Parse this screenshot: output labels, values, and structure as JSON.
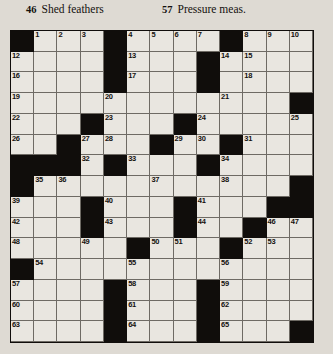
{
  "header": {
    "clues": [
      {
        "number": "46",
        "text": "Shed feathers"
      },
      {
        "number": "57",
        "text": "Pressure meas."
      }
    ]
  },
  "grid": {
    "rows": 15,
    "columns": 13,
    "colors": {
      "block": "#100d0b",
      "cell": "#e9e6e0",
      "rule": "#6e6a64",
      "page": "#dedad3",
      "text": "#14110e"
    },
    "layout": [
      "#...#....#....",
      "....#....#....",
      "....#....#....",
      "............#",
      "...#...#.....",
      "..#...#..#...",
      "###.#...#....",
      "#..........#.",
      "...#...#..###",
      "...#...#..#..",
      ".....#...#...",
      "#............",
      "....#...#....",
      "....#...#....",
      "....#...#...#"
    ],
    "numbers": {
      "0": {
        "1": "1",
        "2": "2",
        "3": "3",
        "5": "4",
        "6": "5",
        "7": "6",
        "8": "7",
        "10": "8",
        "11": "9",
        "12": "10"
      },
      "0b": {},
      "1": {
        "0": "12",
        "5": "13",
        "9": "14",
        "10": "15"
      },
      "2": {
        "0": "16",
        "5": "17",
        "10": "18"
      },
      "3": {
        "0": "19",
        "4": "20",
        "9": "21"
      },
      "4": {
        "0": "22",
        "4": "23",
        "8": "24",
        "12": "25"
      },
      "5": {
        "0": "26",
        "3": "27",
        "4": "28",
        "7": "29",
        "8": "30",
        "10": "31"
      },
      "6": {
        "3": "32",
        "5": "33",
        "9": "34"
      },
      "7": {
        "1": "35",
        "2": "36",
        "6": "37",
        "9": "38"
      },
      "8": {
        "0": "39",
        "4": "40",
        "8": "41"
      },
      "9": {
        "0": "42",
        "4": "43",
        "8": "44",
        "11": "45",
        "12": "46",
        "13": "47"
      },
      "10": {
        "0": "48",
        "3": "49",
        "6": "50",
        "7": "51",
        "10": "52",
        "11": "53"
      },
      "11": {
        "1": "54",
        "5": "55",
        "9": "56"
      },
      "12": {
        "0": "57",
        "5": "58",
        "9": "59"
      },
      "13": {
        "0": "60",
        "5": "61",
        "9": "62"
      },
      "14": {
        "0": "63",
        "5": "64",
        "9": "65"
      }
    },
    "numbers_flat": [
      {
        "row": 0,
        "col": 1,
        "n": "1"
      },
      {
        "row": 0,
        "col": 2,
        "n": "2"
      },
      {
        "row": 0,
        "col": 3,
        "n": "3"
      },
      {
        "row": 0,
        "col": 5,
        "n": "4"
      },
      {
        "row": 0,
        "col": 6,
        "n": "5"
      },
      {
        "row": 0,
        "col": 7,
        "n": "6"
      },
      {
        "row": 0,
        "col": 8,
        "n": "7"
      },
      {
        "row": 0,
        "col": 10,
        "n": "8"
      },
      {
        "row": 0,
        "col": 11,
        "n": "9"
      },
      {
        "row": 0,
        "col": 12,
        "n": "10"
      },
      {
        "row": 0,
        "col": 12,
        "n": "11"
      },
      {
        "row": 1,
        "col": 0,
        "n": "12"
      },
      {
        "row": 1,
        "col": 5,
        "n": "13"
      },
      {
        "row": 1,
        "col": 9,
        "n": "14"
      },
      {
        "row": 1,
        "col": 10,
        "n": "15"
      },
      {
        "row": 2,
        "col": 0,
        "n": "16"
      },
      {
        "row": 2,
        "col": 5,
        "n": "17"
      },
      {
        "row": 2,
        "col": 10,
        "n": "18"
      },
      {
        "row": 3,
        "col": 0,
        "n": "19"
      },
      {
        "row": 3,
        "col": 4,
        "n": "20"
      },
      {
        "row": 3,
        "col": 9,
        "n": "21"
      },
      {
        "row": 4,
        "col": 0,
        "n": "22"
      },
      {
        "row": 4,
        "col": 4,
        "n": "23"
      },
      {
        "row": 4,
        "col": 8,
        "n": "24"
      },
      {
        "row": 4,
        "col": 12,
        "n": "25"
      },
      {
        "row": 5,
        "col": 0,
        "n": "26"
      },
      {
        "row": 5,
        "col": 3,
        "n": "27"
      },
      {
        "row": 5,
        "col": 4,
        "n": "28"
      },
      {
        "row": 5,
        "col": 7,
        "n": "29"
      },
      {
        "row": 5,
        "col": 8,
        "n": "30"
      },
      {
        "row": 5,
        "col": 10,
        "n": "31"
      },
      {
        "row": 6,
        "col": 3,
        "n": "32"
      },
      {
        "row": 6,
        "col": 5,
        "n": "33"
      },
      {
        "row": 6,
        "col": 9,
        "n": "34"
      },
      {
        "row": 7,
        "col": 1,
        "n": "35"
      },
      {
        "row": 7,
        "col": 2,
        "n": "36"
      },
      {
        "row": 7,
        "col": 6,
        "n": "37"
      },
      {
        "row": 7,
        "col": 9,
        "n": "38"
      },
      {
        "row": 8,
        "col": 0,
        "n": "39"
      },
      {
        "row": 8,
        "col": 4,
        "n": "40"
      },
      {
        "row": 8,
        "col": 8,
        "n": "41"
      },
      {
        "row": 9,
        "col": 0,
        "n": "42"
      },
      {
        "row": 9,
        "col": 4,
        "n": "43"
      },
      {
        "row": 9,
        "col": 8,
        "n": "44"
      },
      {
        "row": 9,
        "col": 10,
        "n": "45"
      },
      {
        "row": 9,
        "col": 11,
        "n": "46"
      },
      {
        "row": 9,
        "col": 12,
        "n": "47"
      },
      {
        "row": 10,
        "col": 0,
        "n": "48"
      },
      {
        "row": 10,
        "col": 3,
        "n": "49"
      },
      {
        "row": 10,
        "col": 6,
        "n": "50"
      },
      {
        "row": 10,
        "col": 7,
        "n": "51"
      },
      {
        "row": 10,
        "col": 10,
        "n": "52"
      },
      {
        "row": 10,
        "col": 11,
        "n": "53"
      },
      {
        "row": 11,
        "col": 1,
        "n": "54"
      },
      {
        "row": 11,
        "col": 5,
        "n": "55"
      },
      {
        "row": 11,
        "col": 9,
        "n": "56"
      },
      {
        "row": 12,
        "col": 0,
        "n": "57"
      },
      {
        "row": 12,
        "col": 5,
        "n": "58"
      },
      {
        "row": 12,
        "col": 9,
        "n": "59"
      },
      {
        "row": 13,
        "col": 0,
        "n": "60"
      },
      {
        "row": 13,
        "col": 5,
        "n": "61"
      },
      {
        "row": 13,
        "col": 9,
        "n": "62"
      },
      {
        "row": 14,
        "col": 0,
        "n": "63"
      },
      {
        "row": 14,
        "col": 5,
        "n": "64"
      },
      {
        "row": 14,
        "col": 9,
        "n": "65"
      }
    ],
    "blocks": [
      {
        "row": 0,
        "col": 0
      },
      {
        "row": 0,
        "col": 4
      },
      {
        "row": 0,
        "col": 9
      },
      {
        "row": 1,
        "col": 4
      },
      {
        "row": 1,
        "col": 8
      },
      {
        "row": 2,
        "col": 4
      },
      {
        "row": 2,
        "col": 8
      },
      {
        "row": 3,
        "col": 12
      },
      {
        "row": 4,
        "col": 3
      },
      {
        "row": 4,
        "col": 7
      },
      {
        "row": 5,
        "col": 2
      },
      {
        "row": 5,
        "col": 6
      },
      {
        "row": 5,
        "col": 9
      },
      {
        "row": 6,
        "col": 0
      },
      {
        "row": 6,
        "col": 1
      },
      {
        "row": 6,
        "col": 2
      },
      {
        "row": 6,
        "col": 4
      },
      {
        "row": 6,
        "col": 8
      },
      {
        "row": 7,
        "col": 0
      },
      {
        "row": 7,
        "col": 12
      },
      {
        "row": 8,
        "col": 3
      },
      {
        "row": 8,
        "col": 7
      },
      {
        "row": 8,
        "col": 11
      },
      {
        "row": 8,
        "col": 12
      },
      {
        "row": 9,
        "col": 3
      },
      {
        "row": 9,
        "col": 7
      },
      {
        "row": 9,
        "col": 10
      },
      {
        "row": 10,
        "col": 5
      },
      {
        "row": 10,
        "col": 9
      },
      {
        "row": 11,
        "col": 0
      },
      {
        "row": 12,
        "col": 4
      },
      {
        "row": 12,
        "col": 8
      },
      {
        "row": 13,
        "col": 4
      },
      {
        "row": 13,
        "col": 8
      },
      {
        "row": 14,
        "col": 4
      },
      {
        "row": 14,
        "col": 8
      },
      {
        "row": 14,
        "col": 12
      }
    ]
  }
}
